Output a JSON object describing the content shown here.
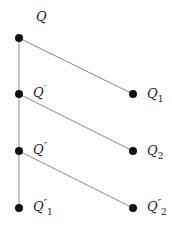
{
  "diagram": {
    "line_color": "#888888",
    "node_color": "#111111",
    "nodes": [
      {
        "id": "Q",
        "label": "Q",
        "prime": "",
        "sub": "",
        "x": 19,
        "y": 38
      },
      {
        "id": "Qp",
        "label": "Q",
        "prime": "′",
        "sub": "",
        "x": 19,
        "y": 94
      },
      {
        "id": "Qpp",
        "label": "Q",
        "prime": "″",
        "sub": "",
        "x": 19,
        "y": 151
      },
      {
        "id": "Qpp1",
        "label": "Q",
        "prime": "″",
        "sub": "1",
        "x": 19,
        "y": 208
      },
      {
        "id": "Q1",
        "label": "Q",
        "prime": "",
        "sub": "1",
        "x": 133,
        "y": 94
      },
      {
        "id": "Q2",
        "label": "Q",
        "prime": "",
        "sub": "2",
        "x": 133,
        "y": 151
      },
      {
        "id": "Qpp2",
        "label": "Q",
        "prime": "″",
        "sub": "2",
        "x": 133,
        "y": 208
      }
    ],
    "edges": [
      [
        "Q",
        "Qp"
      ],
      [
        "Qp",
        "Qpp"
      ],
      [
        "Qpp",
        "Qpp1"
      ],
      [
        "Q",
        "Q1"
      ],
      [
        "Qp",
        "Q2"
      ],
      [
        "Qpp",
        "Qpp2"
      ]
    ]
  }
}
